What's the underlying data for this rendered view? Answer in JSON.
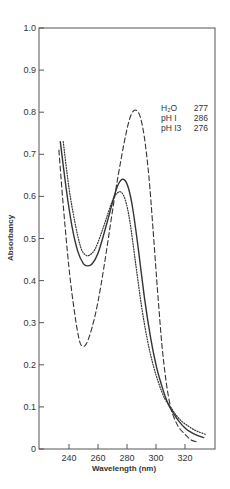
{
  "chart_data": {
    "type": "line",
    "title": "",
    "xlabel": "Wavelength (nm)",
    "ylabel": "Absorbancy",
    "xlim": [
      219,
      340
    ],
    "ylim": [
      0,
      1.0
    ],
    "x_ticks": [
      240,
      260,
      280,
      300,
      320
    ],
    "y_ticks": [
      0,
      0.1,
      0.2,
      0.3,
      0.4,
      0.5,
      0.6,
      0.7,
      0.8,
      0.9,
      1.0
    ],
    "y_tick_labels": [
      "0",
      "0.1",
      "0.2",
      "0.3",
      "0.4",
      "0.5",
      "0.6",
      "0.7",
      "0.8",
      "0.9",
      "1.0"
    ],
    "grid": false,
    "legend_position": "upper right (text annotation)",
    "annotation": [
      {
        "label": "H2O",
        "label_display": "H₂O",
        "value": "277"
      },
      {
        "label": "pH 1",
        "label_display": "pH I",
        "value": "286"
      },
      {
        "label": "pH 13",
        "label_display": "pH I3",
        "value": "276"
      }
    ],
    "series": [
      {
        "name": "H2O",
        "style": "solid",
        "lambda_max": 277,
        "x": [
          234,
          238,
          242,
          246,
          250,
          253,
          256,
          260,
          264,
          268,
          272,
          275,
          278,
          281,
          284,
          288,
          292,
          296,
          300,
          304,
          308,
          312,
          316,
          320,
          324,
          328,
          333
        ],
        "values": [
          0.73,
          0.62,
          0.53,
          0.47,
          0.44,
          0.435,
          0.44,
          0.465,
          0.51,
          0.56,
          0.61,
          0.635,
          0.64,
          0.62,
          0.57,
          0.47,
          0.36,
          0.27,
          0.2,
          0.15,
          0.11,
          0.085,
          0.065,
          0.05,
          0.04,
          0.033,
          0.027
        ]
      },
      {
        "name": "pH 1",
        "style": "dashed",
        "lambda_max": 286,
        "x": [
          233,
          236,
          240,
          244,
          247,
          249,
          252,
          256,
          260,
          264,
          268,
          272,
          276,
          280,
          283,
          286,
          289,
          292,
          295,
          298,
          301,
          304,
          307,
          310,
          313,
          316,
          320,
          324,
          328
        ],
        "values": [
          0.71,
          0.58,
          0.43,
          0.32,
          0.26,
          0.245,
          0.25,
          0.29,
          0.35,
          0.43,
          0.52,
          0.61,
          0.69,
          0.76,
          0.795,
          0.805,
          0.79,
          0.74,
          0.65,
          0.52,
          0.38,
          0.25,
          0.16,
          0.1,
          0.07,
          0.05,
          0.035,
          0.022,
          0.017
        ]
      },
      {
        "name": "pH 13",
        "style": "dotted",
        "lambda_max": 276,
        "x": [
          236,
          240,
          244,
          248,
          251,
          254,
          258,
          262,
          266,
          270,
          273,
          276,
          279,
          282,
          286,
          290,
          294,
          298,
          302,
          306,
          310,
          314,
          318,
          322,
          326,
          330,
          334
        ],
        "values": [
          0.73,
          0.62,
          0.54,
          0.48,
          0.462,
          0.46,
          0.475,
          0.51,
          0.55,
          0.59,
          0.607,
          0.61,
          0.59,
          0.54,
          0.44,
          0.34,
          0.26,
          0.2,
          0.155,
          0.12,
          0.1,
          0.08,
          0.065,
          0.055,
          0.046,
          0.04,
          0.035
        ]
      }
    ]
  },
  "colors": {
    "ink": "#333333",
    "frame": "#555555",
    "background": "#ffffff"
  }
}
